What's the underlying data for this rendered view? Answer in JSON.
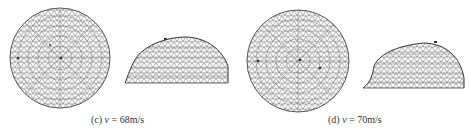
{
  "figure": {
    "panels": [
      {
        "id": "c",
        "label": "(c)",
        "variable": "v",
        "equals": " = ",
        "value": "68m/s",
        "views": [
          "top-view-mesh",
          "side-view-mesh"
        ]
      },
      {
        "id": "d",
        "label": "(d)",
        "variable": "v",
        "equals": " = ",
        "value": "70m/s",
        "views": [
          "top-view-mesh",
          "side-view-mesh"
        ]
      }
    ],
    "colors": {
      "mesh_line": "#555555",
      "background": "#ffffff",
      "caption_text": "#333333"
    }
  }
}
